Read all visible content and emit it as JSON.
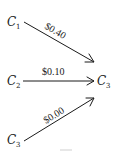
{
  "diagram": {
    "nodes": [
      {
        "id": "c1",
        "letter": "C",
        "sub": "1"
      },
      {
        "id": "c2",
        "letter": "C",
        "sub": "2"
      },
      {
        "id": "c3_src",
        "letter": "C",
        "sub": "3"
      },
      {
        "id": "c3_target",
        "letter": "C",
        "sub": "3"
      }
    ],
    "edges": [
      {
        "from": "c1",
        "to": "c3_target",
        "label": "$0.40"
      },
      {
        "from": "c2",
        "to": "c3_target",
        "label": "$0.10"
      },
      {
        "from": "c3_src",
        "to": "c3_target",
        "label": "$0.00"
      }
    ],
    "colors": {
      "ink": "#1a1a1a",
      "background": "#ffffff"
    }
  }
}
